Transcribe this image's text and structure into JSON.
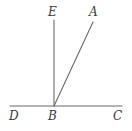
{
  "figure": {
    "type": "geometry-diagram",
    "background_color": "#ffffff",
    "stroke_color": "#6b6b6b",
    "label_color": "#3a3a3a",
    "stroke_width": 1.1,
    "labels": {
      "E": "E",
      "A": "A",
      "D": "D",
      "B": "B",
      "C": "C"
    },
    "points": {
      "D": {
        "x": 10,
        "y": 106
      },
      "B": {
        "x": 54,
        "y": 106
      },
      "C": {
        "x": 122,
        "y": 106
      },
      "E": {
        "x": 54,
        "y": 20
      },
      "A": {
        "x": 93,
        "y": 22
      }
    },
    "segments": [
      {
        "name": "line-DC",
        "x1": 10,
        "y1": 106,
        "x2": 122,
        "y2": 106
      },
      {
        "name": "ray-BE",
        "x1": 54,
        "y1": 106,
        "x2": 54,
        "y2": 20
      },
      {
        "name": "ray-BA",
        "x1": 54,
        "y1": 106,
        "x2": 93,
        "y2": 22
      }
    ]
  }
}
